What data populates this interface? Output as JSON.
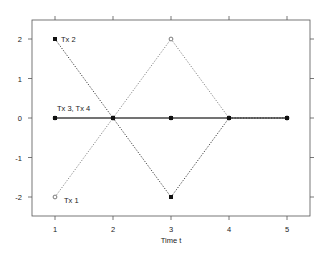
{
  "chart_data": {
    "type": "line",
    "title": "",
    "xlabel": "Time t",
    "ylabel": "",
    "x": [
      1,
      2,
      3,
      4,
      5
    ],
    "xlim": [
      0.6,
      5.4
    ],
    "ylim": [
      -2.5,
      2.5
    ],
    "x_ticks": [
      1,
      2,
      3,
      4,
      5
    ],
    "x_tick_labels": [
      "1",
      "2",
      "3",
      "4",
      "5"
    ],
    "y_ticks": [
      2,
      1,
      0,
      -1,
      -2
    ],
    "y_tick_labels": [
      "2",
      "1",
      "0",
      "-1",
      "-2"
    ],
    "grid": false,
    "legend": "none (inline annotations)",
    "series": [
      {
        "name": "Tx 1",
        "values": [
          -2,
          0,
          2,
          0,
          0
        ],
        "line_style": "dotted",
        "marker": "open-circle",
        "color": "#777777"
      },
      {
        "name": "Tx 2",
        "values": [
          2,
          0,
          -2,
          0,
          0
        ],
        "line_style": "dotted",
        "marker": "filled-square",
        "color": "#222222"
      },
      {
        "name": "Tx 3",
        "values": [
          0,
          0,
          0,
          0,
          0
        ],
        "line_style": "solid",
        "marker": "open-circle",
        "color": "#888888"
      },
      {
        "name": "Tx 4",
        "values": [
          0,
          0,
          0,
          0,
          0
        ],
        "line_style": "solid",
        "marker": "filled-square",
        "color": "#222222"
      }
    ],
    "annotations": [
      {
        "text": "Tx 2",
        "x": 1,
        "y": 2
      },
      {
        "text": "Tx 3, Tx 4",
        "x": 1,
        "y": 0
      },
      {
        "text": "Tx 1",
        "x": 1,
        "y": -2
      }
    ]
  },
  "labels": {
    "xlabel": "Time t",
    "ann_tx2": "Tx 2",
    "ann_tx34": "Tx 3, Tx 4",
    "ann_tx1": "Tx 1",
    "xt1": "1",
    "xt2": "2",
    "xt3": "3",
    "xt4": "4",
    "xt5": "5",
    "yt2": "2",
    "yt1": "1",
    "yt0": "0",
    "ytm1": "-1",
    "ytm2": "-2"
  }
}
